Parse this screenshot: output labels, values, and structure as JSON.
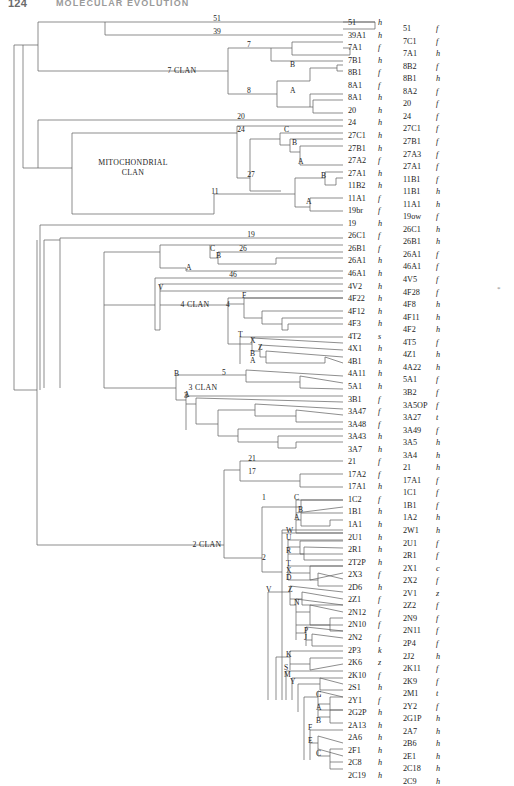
{
  "page": {
    "folio": "124",
    "running_head": "MOLECULAR EVOLUTION"
  },
  "figure": {
    "type": "phylogenetic-tree-dendrogram",
    "orientation": "left-to-right",
    "line_color": "#5d5d5d",
    "clans": [
      {
        "id": "clan-7",
        "label": "7 CLAN"
      },
      {
        "id": "clan-mito",
        "label": "MITOCHONDRIAL CLAN",
        "line1": "MITOCHONDRIAL",
        "line2": "CLAN"
      },
      {
        "id": "clan-4",
        "label": "4 CLAN"
      },
      {
        "id": "clan-3",
        "label": "3 CLAN"
      },
      {
        "id": "clan-2",
        "label": "2 CLAN"
      }
    ],
    "node_numbers": [
      "51",
      "39",
      "7",
      "8",
      "20",
      "24",
      "27",
      "11",
      "19",
      "26",
      "46",
      "4",
      "5",
      "3",
      "21",
      "17",
      "1",
      "2"
    ],
    "node_letters": [
      "B",
      "A",
      "C",
      "B",
      "A",
      "B",
      "A",
      "C",
      "B",
      "A",
      "V",
      "F",
      "T",
      "X",
      "Z",
      "B",
      "A",
      "B",
      "A",
      "C",
      "B",
      "A",
      "W",
      "U",
      "R",
      "T",
      "X",
      "D",
      "V",
      "Z",
      "N",
      "P",
      "J",
      "K",
      "S",
      "M",
      "Y",
      "G",
      "A",
      "B",
      "F",
      "E",
      "C"
    ],
    "margin_mark": "*",
    "columns": {
      "left_header": "",
      "right_header": ""
    },
    "leaves": [
      {
        "code": "51",
        "sfx": "h"
      },
      {
        "code": "39A1",
        "sfx": "h"
      },
      {
        "code": "7A1",
        "sfx": "f"
      },
      {
        "code": "7B1",
        "sfx": "h"
      },
      {
        "code": "8B1",
        "sfx": "f"
      },
      {
        "code": "8A1",
        "sfx": "f"
      },
      {
        "code": "8A1",
        "sfx": "h"
      },
      {
        "code": "20",
        "sfx": "h"
      },
      {
        "code": "24",
        "sfx": "h"
      },
      {
        "code": "27C1",
        "sfx": "h"
      },
      {
        "code": "27B1",
        "sfx": "h"
      },
      {
        "code": "27A2",
        "sfx": "f"
      },
      {
        "code": "27A1",
        "sfx": "h"
      },
      {
        "code": "11B2",
        "sfx": "h"
      },
      {
        "code": "11A1",
        "sfx": "f"
      },
      {
        "code": "19br",
        "sfx": "f"
      },
      {
        "code": "19",
        "sfx": "h"
      },
      {
        "code": "26C1",
        "sfx": "f"
      },
      {
        "code": "26B1",
        "sfx": "f"
      },
      {
        "code": "26A1",
        "sfx": "h"
      },
      {
        "code": "46A1",
        "sfx": "h"
      },
      {
        "code": "4V2",
        "sfx": "h"
      },
      {
        "code": "4F22",
        "sfx": "h"
      },
      {
        "code": "4F12",
        "sfx": "h"
      },
      {
        "code": "4F3",
        "sfx": "h"
      },
      {
        "code": "4T2",
        "sfx": "s"
      },
      {
        "code": "4X1",
        "sfx": "h"
      },
      {
        "code": "4B1",
        "sfx": "h"
      },
      {
        "code": "4A11",
        "sfx": "h"
      },
      {
        "code": "5A1",
        "sfx": "h"
      },
      {
        "code": "3B1",
        "sfx": "f"
      },
      {
        "code": "3A47",
        "sfx": "f"
      },
      {
        "code": "3A48",
        "sfx": "f"
      },
      {
        "code": "3A43",
        "sfx": "h"
      },
      {
        "code": "3A7",
        "sfx": "h"
      },
      {
        "code": "21",
        "sfx": "f"
      },
      {
        "code": "17A2",
        "sfx": "f"
      },
      {
        "code": "17A1",
        "sfx": "h"
      },
      {
        "code": "1C2",
        "sfx": "f"
      },
      {
        "code": "1B1",
        "sfx": "h"
      },
      {
        "code": "1A1",
        "sfx": "h"
      },
      {
        "code": "2U1",
        "sfx": "h"
      },
      {
        "code": "2R1",
        "sfx": "h"
      },
      {
        "code": "2T2P",
        "sfx": "h"
      },
      {
        "code": "2X3",
        "sfx": "f"
      },
      {
        "code": "2D6",
        "sfx": "h"
      },
      {
        "code": "2Z1",
        "sfx": "f"
      },
      {
        "code": "2N12",
        "sfx": "f"
      },
      {
        "code": "2N10",
        "sfx": "f"
      },
      {
        "code": "2N2",
        "sfx": "f"
      },
      {
        "code": "2P3",
        "sfx": "k"
      },
      {
        "code": "2K6",
        "sfx": "z"
      },
      {
        "code": "2K10",
        "sfx": "f"
      },
      {
        "code": "2S1",
        "sfx": "h"
      },
      {
        "code": "2Y1",
        "sfx": "f"
      },
      {
        "code": "2G2P",
        "sfx": "h"
      },
      {
        "code": "2A13",
        "sfx": "h"
      },
      {
        "code": "2A6",
        "sfx": "h"
      },
      {
        "code": "2F1",
        "sfx": "h"
      },
      {
        "code": "2C8",
        "sfx": "h"
      },
      {
        "code": "2C19",
        "sfx": "h"
      }
    ],
    "leaves_right": [
      {
        "code": "51",
        "sfx": "f"
      },
      {
        "code": "7C1",
        "sfx": "f"
      },
      {
        "code": "7A1",
        "sfx": "h"
      },
      {
        "code": "8B2",
        "sfx": "f"
      },
      {
        "code": "8B1",
        "sfx": "h"
      },
      {
        "code": "8A2",
        "sfx": "f"
      },
      {
        "code": "20",
        "sfx": "f"
      },
      {
        "code": "24",
        "sfx": "f"
      },
      {
        "code": "27C1",
        "sfx": "f"
      },
      {
        "code": "27B1",
        "sfx": "f"
      },
      {
        "code": "27A3",
        "sfx": "f"
      },
      {
        "code": "27A1",
        "sfx": "f"
      },
      {
        "code": "11B1",
        "sfx": "f"
      },
      {
        "code": "11B1",
        "sfx": "h"
      },
      {
        "code": "11A1",
        "sfx": "h"
      },
      {
        "code": "19ow",
        "sfx": "f"
      },
      {
        "code": "26C1",
        "sfx": "h"
      },
      {
        "code": "26B1",
        "sfx": "h"
      },
      {
        "code": "26A1",
        "sfx": "f"
      },
      {
        "code": "46A1",
        "sfx": "f"
      },
      {
        "code": "4V5",
        "sfx": "f"
      },
      {
        "code": "4F28",
        "sfx": "f"
      },
      {
        "code": "4F8",
        "sfx": "h"
      },
      {
        "code": "4F11",
        "sfx": "h"
      },
      {
        "code": "4F2",
        "sfx": "h"
      },
      {
        "code": "4T5",
        "sfx": "f"
      },
      {
        "code": "4Z1",
        "sfx": "h"
      },
      {
        "code": "4A22",
        "sfx": "h"
      },
      {
        "code": "5A1",
        "sfx": "f"
      },
      {
        "code": "3B2",
        "sfx": "f"
      },
      {
        "code": "3A5OP",
        "sfx": "f"
      },
      {
        "code": "3A27",
        "sfx": "t"
      },
      {
        "code": "3A49",
        "sfx": "f"
      },
      {
        "code": "3A5",
        "sfx": "h"
      },
      {
        "code": "3A4",
        "sfx": "h"
      },
      {
        "code": "21",
        "sfx": "h"
      },
      {
        "code": "17A1",
        "sfx": "f"
      },
      {
        "code": "1C1",
        "sfx": "f"
      },
      {
        "code": "1B1",
        "sfx": "f"
      },
      {
        "code": "1A2",
        "sfx": "h"
      },
      {
        "code": "2W1",
        "sfx": "h"
      },
      {
        "code": "2U1",
        "sfx": "f"
      },
      {
        "code": "2R1",
        "sfx": "f"
      },
      {
        "code": "2X1",
        "sfx": "c"
      },
      {
        "code": "2X2",
        "sfx": "f"
      },
      {
        "code": "2V1",
        "sfx": "z"
      },
      {
        "code": "2Z2",
        "sfx": "f"
      },
      {
        "code": "2N9",
        "sfx": "f"
      },
      {
        "code": "2N11",
        "sfx": "f"
      },
      {
        "code": "2P4",
        "sfx": "f"
      },
      {
        "code": "2J2",
        "sfx": "h"
      },
      {
        "code": "2K11",
        "sfx": "f"
      },
      {
        "code": "2K9",
        "sfx": "f"
      },
      {
        "code": "2M1",
        "sfx": "t"
      },
      {
        "code": "2Y2",
        "sfx": "f"
      },
      {
        "code": "2G1P",
        "sfx": "h"
      },
      {
        "code": "2A7",
        "sfx": "h"
      },
      {
        "code": "2B6",
        "sfx": "h"
      },
      {
        "code": "2E1",
        "sfx": "h"
      },
      {
        "code": "2C18",
        "sfx": "h"
      },
      {
        "code": "2C9",
        "sfx": "h"
      }
    ]
  }
}
